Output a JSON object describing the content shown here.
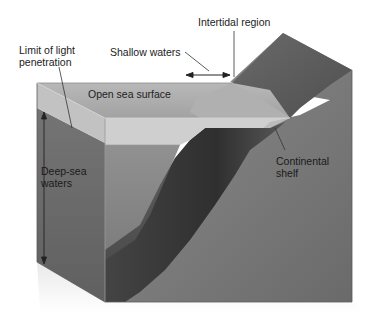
{
  "figure": {
    "type": "ocean-zones-block-diagram",
    "colors": {
      "background": "#ffffff",
      "sea_surface": "#a9a9a9",
      "photic_zone_front": "#bdbdbd",
      "deep_water_side": "#6f6f6f",
      "deep_water_front": "#4a4a4a",
      "slope_dark": "#3a3a3a",
      "land": "#7d7d7d",
      "land_top": "#5e5e5e",
      "leader_line": "#333333",
      "text": "#222222"
    },
    "labels": {
      "intertidal": "Intertidal region",
      "shallow": "Shallow waters",
      "light_limit_line1": "Limit of light",
      "light_limit_line2": "penetration",
      "open_sea": "Open sea surface",
      "deep_sea_line1": "Deep-sea",
      "deep_sea_line2": "waters",
      "shelf_line1": "Continental",
      "shelf_line2": "shelf"
    }
  }
}
